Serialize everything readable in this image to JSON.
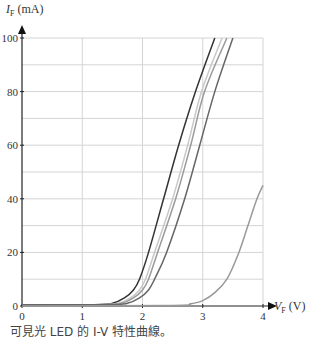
{
  "chart_data": {
    "type": "line",
    "title": "",
    "caption": "可見光 LED 的 I-V 特性曲線。",
    "xlabel": "V_F (V)",
    "ylabel": "I_F (mA)",
    "xlim": [
      0,
      4
    ],
    "ylim": [
      0,
      100
    ],
    "x_ticks": [
      "0",
      "1",
      "2",
      "3",
      "4"
    ],
    "y_ticks": [
      "0",
      "20",
      "40",
      "60",
      "80",
      "100"
    ],
    "grid": true,
    "legend": "none",
    "series": [
      {
        "name": "LED 1",
        "color": "#333333",
        "points": [
          [
            0,
            0.5
          ],
          [
            1.2,
            0.5
          ],
          [
            1.5,
            1
          ],
          [
            1.7,
            3
          ],
          [
            1.85,
            6
          ],
          [
            1.95,
            10
          ],
          [
            2.1,
            20
          ],
          [
            2.35,
            40
          ],
          [
            2.6,
            60
          ],
          [
            2.88,
            80
          ],
          [
            3.2,
            100
          ]
        ]
      },
      {
        "name": "LED 2",
        "color": "#c8c8c8",
        "points": [
          [
            0,
            0.5
          ],
          [
            1.3,
            0.5
          ],
          [
            1.6,
            1
          ],
          [
            1.8,
            3
          ],
          [
            1.95,
            6
          ],
          [
            2.05,
            10
          ],
          [
            2.2,
            20
          ],
          [
            2.5,
            40
          ],
          [
            2.75,
            60
          ],
          [
            2.98,
            80
          ],
          [
            3.32,
            100
          ]
        ]
      },
      {
        "name": "LED 3",
        "color": "#9a9a9a",
        "points": [
          [
            0,
            0.5
          ],
          [
            1.3,
            0.5
          ],
          [
            1.65,
            1
          ],
          [
            1.85,
            3
          ],
          [
            2.0,
            6
          ],
          [
            2.1,
            10
          ],
          [
            2.25,
            20
          ],
          [
            2.55,
            40
          ],
          [
            2.8,
            60
          ],
          [
            3.03,
            80
          ],
          [
            3.4,
            100
          ]
        ]
      },
      {
        "name": "LED 4",
        "color": "#666666",
        "points": [
          [
            0,
            0.5
          ],
          [
            1.4,
            0.5
          ],
          [
            1.75,
            1
          ],
          [
            1.95,
            3
          ],
          [
            2.1,
            6
          ],
          [
            2.2,
            10
          ],
          [
            2.4,
            20
          ],
          [
            2.7,
            40
          ],
          [
            2.95,
            60
          ],
          [
            3.2,
            80
          ],
          [
            3.5,
            100
          ]
        ]
      },
      {
        "name": "LED 5",
        "color": "#999999",
        "points": [
          [
            0,
            0
          ],
          [
            2.5,
            0.2
          ],
          [
            2.8,
            0.8
          ],
          [
            3.0,
            2
          ],
          [
            3.2,
            5
          ],
          [
            3.4,
            10
          ],
          [
            3.6,
            20
          ],
          [
            3.75,
            30
          ],
          [
            3.9,
            40
          ],
          [
            4.0,
            45
          ]
        ]
      }
    ]
  },
  "labels": {
    "y_axis_main": "I",
    "y_axis_sub": "F",
    "y_axis_unit": "(mA)",
    "x_axis_main": "V",
    "x_axis_sub": "F",
    "x_axis_unit": "(V)"
  }
}
